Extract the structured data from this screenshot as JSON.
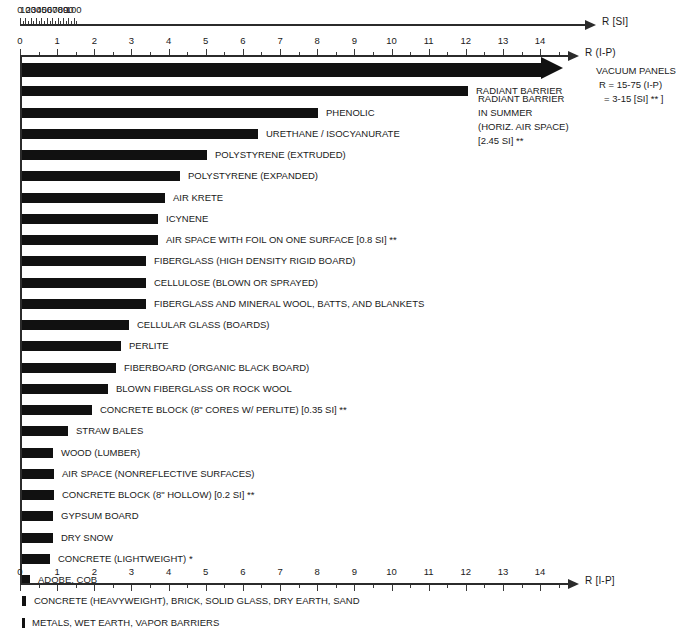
{
  "chart_data": {
    "type": "bar",
    "title": "",
    "orientation": "horizontal",
    "xlabel": "R",
    "ylabel": "",
    "grid": false,
    "legend": "none",
    "axes": [
      {
        "name": "R [SI]",
        "caption": "R  [SI]",
        "position": "top",
        "min": 0,
        "max": 105,
        "major_step": 10,
        "minor_step": 5,
        "tick_labels": [
          "0",
          "10",
          "20",
          "30",
          "40",
          "50",
          "60",
          "70",
          "80",
          "90",
          "100"
        ]
      },
      {
        "name": "R (I-P)",
        "caption": "R  (I-P)",
        "position": "upper",
        "min": 0,
        "max": 14.6,
        "major_step": 1,
        "minor_step": 0.5,
        "tick_labels": [
          "0",
          "1",
          "2",
          "3",
          "4",
          "5",
          "6",
          "7",
          "8",
          "9",
          "10",
          "11",
          "12",
          "13",
          "14"
        ]
      },
      {
        "name": "R [I-P]",
        "caption": "R  [I-P]",
        "position": "bottom",
        "min": 0,
        "max": 14.6,
        "major_step": 1,
        "minor_step": 0.5,
        "tick_labels": [
          "0",
          "1",
          "2",
          "3",
          "4",
          "5",
          "6",
          "7",
          "8",
          "9",
          "10",
          "11",
          "12",
          "13",
          "14"
        ]
      }
    ],
    "unit": "R-value per inch (I-P)",
    "categories": [
      "VACUUM PANELS",
      "RADIANT BARRIER IN SUMMER (HORIZ. AIR SPACE)",
      "PHENOLIC",
      "URETHANE / ISOCYANURATE",
      "POLYSTYRENE (EXTRUDED)",
      "POLYSTYRENE (EXPANDED)",
      "AIR KRETE",
      "ICYNENE",
      "AIR SPACE WITH FOIL ON ONE SURFACE",
      "FIBERGLASS (HIGH DENSITY RIGID BOARD)",
      "CELLULOSE (BLOWN OR SPRAYED)",
      "FIBERGLASS AND MINERAL WOOL, BATTS, AND BLANKETS",
      "CELLULAR GLASS (BOARDS)",
      "PERLITE",
      "FIBERBOARD (ORGANIC BLACK BOARD)",
      "BLOWN FIBERGLASS OR ROCK WOOL",
      "CONCRETE BLOCK (8\" CORES W/ PERLITE)",
      "STRAW BALES",
      "WOOD (LUMBER)",
      "AIR SPACE (NONREFLECTIVE SURFACES)",
      "CONCRETE BLOCK (8\" HOLLOW)",
      "GYPSUM BOARD",
      "DRY SNOW",
      "CONCRETE (LIGHTWEIGHT)",
      "ADOBE, COB",
      "CONCRETE (HEAVYWEIGHT), BRICK, SOLID GLASS, DRY EARTH, SAND",
      "METALS, WET EARTH, VAPOR BARRIERS"
    ],
    "values": [
      15.2,
      12.1,
      8.0,
      6.4,
      5.0,
      4.3,
      3.9,
      3.8,
      3.8,
      3.4,
      3.4,
      3.3,
      2.9,
      2.75,
      2.6,
      2.45,
      2.0,
      1.3,
      0.9,
      0.95,
      0.9,
      0.9,
      0.9,
      0.8,
      0.27,
      0.1,
      0.02
    ]
  },
  "axis_top": {
    "caption": "R  [SI]",
    "labels": [
      "0",
      "10",
      "20",
      "30",
      "40",
      "50",
      "60",
      "70",
      "80",
      "90",
      "100"
    ]
  },
  "axis_mid": {
    "caption": "R  (I-P)",
    "labels": [
      "0",
      "1",
      "2",
      "3",
      "4",
      "5",
      "6",
      "7",
      "8",
      "9",
      "10",
      "11",
      "12",
      "13",
      "14"
    ]
  },
  "axis_bottom": {
    "caption": "R  [I-P]",
    "labels": [
      "0",
      "1",
      "2",
      "3",
      "4",
      "5",
      "6",
      "7",
      "8",
      "9",
      "10",
      "11",
      "12",
      "13",
      "14"
    ]
  },
  "bars": [
    {
      "label": "",
      "value": 15.2,
      "end_px": 563,
      "arrow": true
    },
    {
      "label": "RADIANT BARRIER",
      "value": 12.1,
      "end_px": 468,
      "arrow": false
    },
    {
      "label": "PHENOLIC",
      "value": 8.0,
      "end_px": 318,
      "arrow": false
    },
    {
      "label": "URETHANE / ISOCYANURATE",
      "value": 6.4,
      "end_px": 258,
      "arrow": false
    },
    {
      "label": "POLYSTYRENE (EXTRUDED)",
      "value": 5.0,
      "end_px": 207,
      "arrow": false
    },
    {
      "label": "POLYSTYRENE (EXPANDED)",
      "value": 4.3,
      "end_px": 180,
      "arrow": false
    },
    {
      "label": "AIR KRETE",
      "value": 3.9,
      "end_px": 165,
      "arrow": false
    },
    {
      "label": "ICYNENE",
      "value": 3.8,
      "end_px": 158,
      "arrow": false
    },
    {
      "label": "AIR SPACE WITH FOIL ON ONE SURFACE  [0.8 SI] **",
      "value": 3.8,
      "end_px": 158,
      "arrow": false
    },
    {
      "label": "FIBERGLASS (HIGH DENSITY RIGID BOARD)",
      "value": 3.4,
      "end_px": 146,
      "arrow": false
    },
    {
      "label": "CELLULOSE (BLOWN OR SPRAYED)",
      "value": 3.4,
      "end_px": 146,
      "arrow": false
    },
    {
      "label": "FIBERGLASS AND MINERAL WOOL, BATTS, AND BLANKETS",
      "value": 3.3,
      "end_px": 146,
      "arrow": false
    },
    {
      "label": "CELLULAR GLASS (BOARDS)",
      "value": 2.9,
      "end_px": 129,
      "arrow": false
    },
    {
      "label": "PERLITE",
      "value": 2.75,
      "end_px": 121,
      "arrow": false
    },
    {
      "label": "FIBERBOARD (ORGANIC BLACK BOARD)",
      "value": 2.6,
      "end_px": 116,
      "arrow": false
    },
    {
      "label": "BLOWN FIBERGLASS OR ROCK WOOL",
      "value": 2.45,
      "end_px": 108,
      "arrow": false
    },
    {
      "label": "CONCRETE BLOCK (8\" CORES W/ PERLITE)  [0.35 SI] **",
      "value": 2.0,
      "end_px": 92,
      "arrow": false
    },
    {
      "label": "STRAW BALES",
      "value": 1.3,
      "end_px": 68,
      "arrow": false
    },
    {
      "label": "WOOD (LUMBER)",
      "value": 0.9,
      "end_px": 53,
      "arrow": false
    },
    {
      "label": "AIR SPACE (NONREFLECTIVE SURFACES)",
      "value": 0.95,
      "end_px": 54,
      "arrow": false
    },
    {
      "label": "CONCRETE BLOCK (8\" HOLLOW)  [0.2 SI] **",
      "value": 0.9,
      "end_px": 54,
      "arrow": false
    },
    {
      "label": "GYPSUM BOARD",
      "value": 0.9,
      "end_px": 53,
      "arrow": false
    },
    {
      "label": "DRY SNOW",
      "value": 0.9,
      "end_px": 53,
      "arrow": false
    },
    {
      "label": "CONCRETE (LIGHTWEIGHT) *",
      "value": 0.8,
      "end_px": 50,
      "arrow": false
    },
    {
      "label": "ADOBE, COB",
      "value": 0.27,
      "end_px": 30,
      "arrow": false
    },
    {
      "label": "CONCRETE (HEAVYWEIGHT), BRICK, SOLID GLASS, DRY EARTH, SAND",
      "value": 0.1,
      "end_px": 26,
      "arrow": false
    },
    {
      "label": "METALS, WET EARTH, VAPOR BARRIERS",
      "value": 0.02,
      "end_px": 24,
      "arrow": false
    }
  ],
  "annotations": {
    "vacuum": {
      "line1": "VACUUM PANELS",
      "line2": "R = 15-75  (I-P)",
      "line3": "= 3-15  [SI] ** ]"
    },
    "radiant": {
      "line1": "RADIANT BARRIER",
      "line2": "IN SUMMER",
      "line3": "(HORIZ. AIR SPACE)",
      "line4": "[2.45 SI] **"
    }
  },
  "colors": {
    "bar": "#111111",
    "axis": "#2b2b2b",
    "text": "#1a1a1a",
    "background": "#ffffff"
  }
}
